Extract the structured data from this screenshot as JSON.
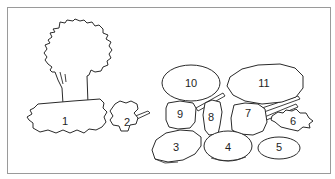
{
  "diagram": {
    "type": "numbered-illustration",
    "frame": {
      "border_color": "#9a9a9a"
    },
    "line_color": "#2a2a2a",
    "items": [
      {
        "number": "1",
        "label": "1",
        "shape": "pot-ground",
        "x": 65,
        "y": 121
      },
      {
        "number": "2",
        "label": "2",
        "shape": "small-pan",
        "x": 127,
        "y": 122
      },
      {
        "number": "3",
        "label": "3",
        "shape": "plate",
        "x": 176,
        "y": 147
      },
      {
        "number": "4",
        "label": "4",
        "shape": "plate",
        "x": 228,
        "y": 147
      },
      {
        "number": "5",
        "label": "5",
        "shape": "oval-dish",
        "x": 279,
        "y": 147
      },
      {
        "number": "6",
        "label": "6",
        "shape": "leaf",
        "x": 293,
        "y": 121
      },
      {
        "number": "7",
        "label": "7",
        "shape": "pot",
        "x": 248,
        "y": 113
      },
      {
        "number": "8",
        "label": "8",
        "shape": "cup",
        "x": 211,
        "y": 117
      },
      {
        "number": "9",
        "label": "9",
        "shape": "bowl",
        "x": 180,
        "y": 114
      },
      {
        "number": "10",
        "label": "10",
        "shape": "oval-dish",
        "x": 191,
        "y": 83
      },
      {
        "number": "11",
        "label": "11",
        "shape": "large-pan",
        "x": 264,
        "y": 83
      }
    ]
  }
}
